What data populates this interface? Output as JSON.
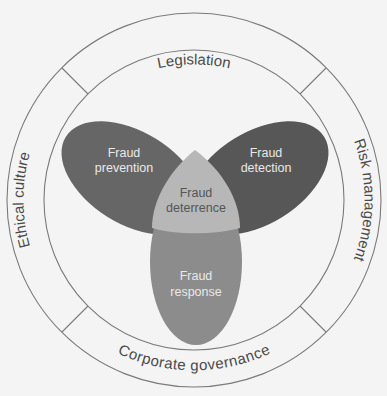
{
  "diagram": {
    "outer_ring": {
      "segments": [
        {
          "id": "top",
          "label": "Legislation"
        },
        {
          "id": "right",
          "label": "Risk management"
        },
        {
          "id": "bottom",
          "label": "Corporate governance"
        },
        {
          "id": "left",
          "label": "Ethical culture"
        }
      ]
    },
    "petals": [
      {
        "id": "prevention",
        "line1": "Fraud",
        "line2": "prevention",
        "color": "#666666"
      },
      {
        "id": "detection",
        "line1": "Fraud",
        "line2": "detection",
        "color": "#575757"
      },
      {
        "id": "response",
        "line1": "Fraud",
        "line2": "response",
        "color": "#8c8c8c"
      }
    ],
    "center": {
      "line1": "Fraud",
      "line2": "deterrence",
      "color": "#b7b7b7"
    }
  }
}
